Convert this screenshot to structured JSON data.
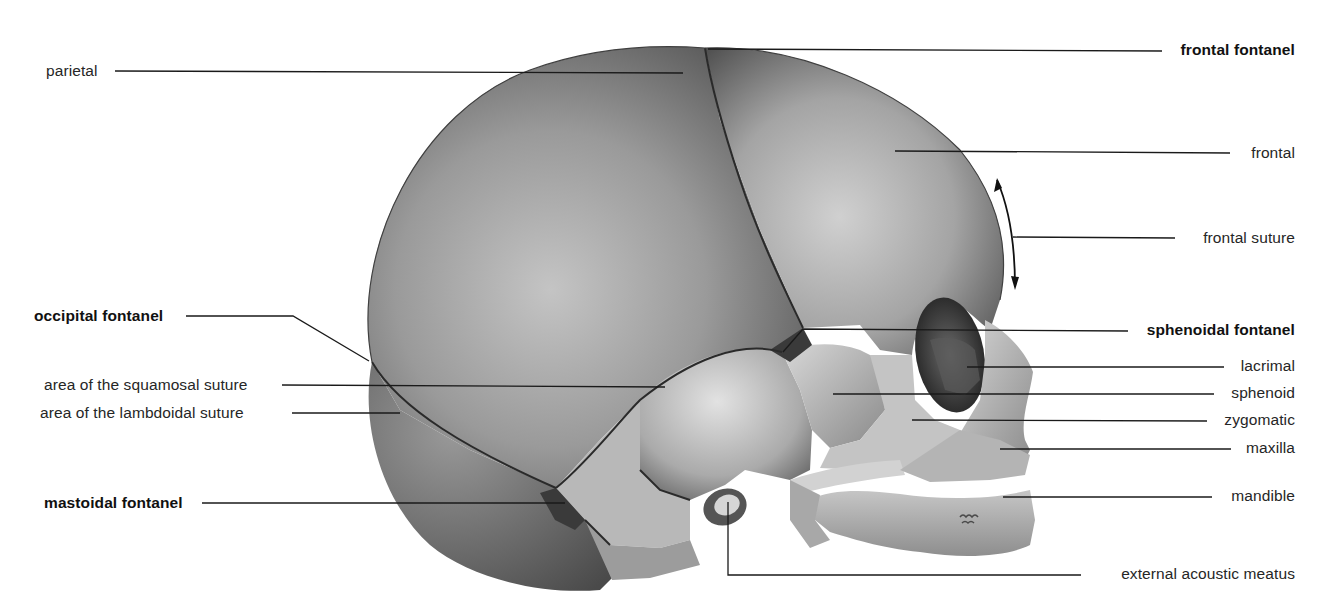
{
  "figure": {
    "colors": {
      "background": "#ffffff",
      "bone_dark": "#5a5a5a",
      "bone_mid": "#8c8c8c",
      "bone_light": "#c8c8c8",
      "suture": "#2a2a2a",
      "leader_line": "#1a1a1a",
      "text": "#262626"
    }
  },
  "labels": {
    "left": [
      {
        "id": "parietal",
        "text": "parietal",
        "bold": false
      },
      {
        "id": "occipital_fontanel",
        "text": "occipital fontanel",
        "bold": true
      },
      {
        "id": "squamosal_suture",
        "text": "area of the squamosal suture",
        "bold": false
      },
      {
        "id": "lambdoidal_suture",
        "text": "area of the lambdoidal suture",
        "bold": false
      },
      {
        "id": "mastoidal_fontanel",
        "text": "mastoidal fontanel",
        "bold": true
      }
    ],
    "right": [
      {
        "id": "frontal_fontanel",
        "text": "frontal fontanel",
        "bold": true
      },
      {
        "id": "frontal",
        "text": "frontal",
        "bold": false
      },
      {
        "id": "frontal_suture",
        "text": "frontal suture",
        "bold": false
      },
      {
        "id": "sphenoidal_fontanel",
        "text": "sphenoidal fontanel",
        "bold": true
      },
      {
        "id": "lacrimal",
        "text": "lacrimal",
        "bold": false
      },
      {
        "id": "sphenoid",
        "text": "sphenoid",
        "bold": false
      },
      {
        "id": "zygomatic",
        "text": "zygomatic",
        "bold": false
      },
      {
        "id": "maxilla",
        "text": "maxilla",
        "bold": false
      },
      {
        "id": "mandible",
        "text": "mandible",
        "bold": false
      }
    ],
    "bottom": [
      {
        "id": "external_acoustic_meatus",
        "text": "external acoustic meatus",
        "bold": false
      }
    ]
  }
}
